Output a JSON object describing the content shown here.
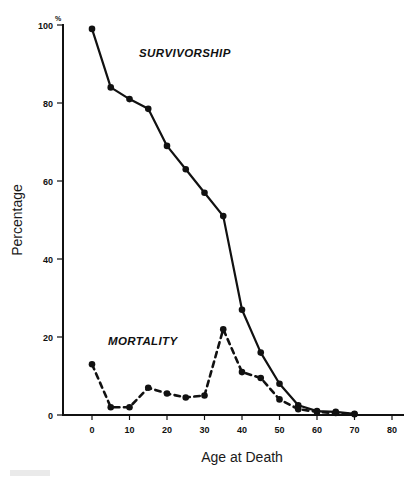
{
  "chart_data": {
    "type": "line",
    "title": "",
    "xlabel": "Age at Death",
    "ylabel": "Percentage",
    "xlim": [
      -5,
      80
    ],
    "ylim": [
      0,
      100
    ],
    "xticks": [
      0,
      10,
      20,
      30,
      40,
      50,
      60,
      70,
      80
    ],
    "yticks": [
      0,
      20,
      40,
      60,
      80,
      100
    ],
    "y_axis_unit": "%",
    "grid": false,
    "legend_position": "inline-annotation",
    "x": [
      0,
      5,
      10,
      15,
      20,
      25,
      30,
      35,
      40,
      45,
      50,
      55,
      60,
      65,
      70
    ],
    "series": [
      {
        "name": "SURVIVORSHIP",
        "style": "solid",
        "color": "#111111",
        "marker": "filled-circle",
        "values": [
          99,
          84,
          81,
          78.5,
          69,
          63,
          57,
          51,
          27,
          16,
          8,
          2.5,
          1,
          0.8,
          0.3
        ]
      },
      {
        "name": "MORTALITY",
        "style": "dashed",
        "color": "#111111",
        "marker": "filled-circle",
        "values": [
          13,
          2,
          2,
          7,
          5.5,
          4.5,
          5,
          22,
          11,
          9.5,
          4,
          1.5,
          0.8,
          0.5,
          0.2
        ]
      }
    ],
    "annotations": [
      {
        "text": "SURVIVORSHIP",
        "x_px": 139,
        "y_px": 57
      },
      {
        "text": "MORTALITY",
        "x_px": 108,
        "y_px": 345
      }
    ]
  }
}
